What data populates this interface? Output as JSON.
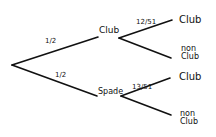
{
  "diagram": {
    "type": "probability-tree",
    "stroke_color": "#111111",
    "root": {
      "branches": [
        {
          "probability": "1/2",
          "label": "Club",
          "branches": [
            {
              "probability": "12/51",
              "label": "Club"
            },
            {
              "probability": "",
              "label_line1": "non",
              "label_line2": "Club"
            }
          ]
        },
        {
          "probability": "1/2",
          "label": "Spade",
          "branches": [
            {
              "probability": "13/51",
              "label": "Club"
            },
            {
              "probability": "",
              "label_line1": "non",
              "label_line2": "Club"
            }
          ]
        }
      ]
    }
  }
}
